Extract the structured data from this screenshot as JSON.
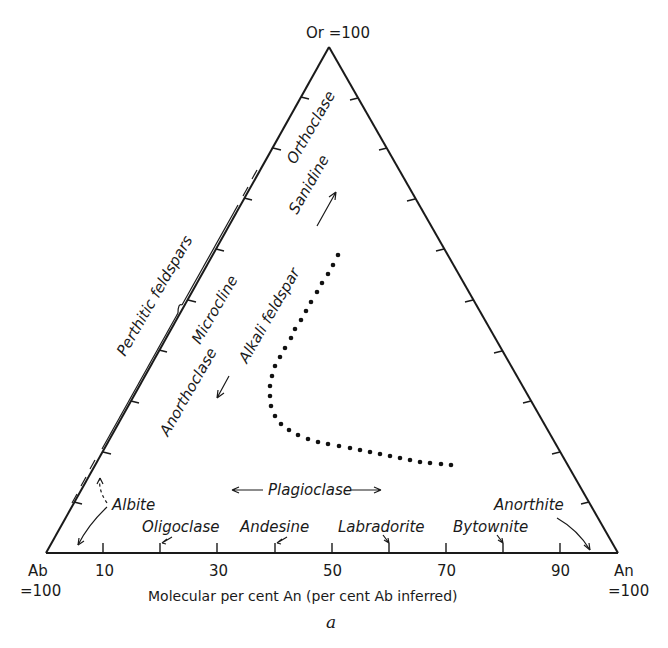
{
  "diagram": {
    "type": "ternary",
    "caption": "a",
    "apices": {
      "top": {
        "label": "Or =100"
      },
      "left": {
        "label_line1": "Ab",
        "label_line2": "=100"
      },
      "right": {
        "label_line1": "An",
        "label_line2": "=100"
      }
    },
    "axis_title": "Molecular per cent An (per cent Ab inferred)",
    "bottom_ticks": [
      {
        "value": 10,
        "label": "10"
      },
      {
        "value": 30,
        "label": "30"
      },
      {
        "value": 50,
        "label": "50"
      },
      {
        "value": 70,
        "label": "70"
      },
      {
        "value": 90,
        "label": "90"
      }
    ],
    "plagioclase_series": {
      "label": "Plagioclase",
      "members": [
        {
          "name": "Albite",
          "range": "0-10"
        },
        {
          "name": "Oligoclase",
          "range": "10-30",
          "boundary_marker": 20
        },
        {
          "name": "Andesine",
          "range": "30-50",
          "boundary_marker": 40
        },
        {
          "name": "Labradorite",
          "range": "50-70",
          "boundary_marker": 60
        },
        {
          "name": "Bytownite",
          "range": "70-90",
          "boundary_marker": 80
        },
        {
          "name": "Anorthite",
          "range": "90-100"
        }
      ]
    },
    "alkali_series": {
      "label": "Alkali feldspar",
      "members_high_temp": [
        "Sanidine",
        "Anorthoclase"
      ],
      "members_low_temp": [
        "Orthoclase",
        "Microcline"
      ]
    },
    "perthitic_label": "Perthitic feldspars",
    "solvus_curve": {
      "description": "dotted curve showing limit of solid solution",
      "points_pct": [
        {
          "An": 13,
          "Or": 58
        },
        {
          "An": 10,
          "Or": 38
        },
        {
          "An": 12,
          "Or": 24
        },
        {
          "An": 30,
          "Or": 17
        },
        {
          "An": 52,
          "Or": 14
        },
        {
          "An": 62,
          "Or": 13
        }
      ]
    }
  }
}
